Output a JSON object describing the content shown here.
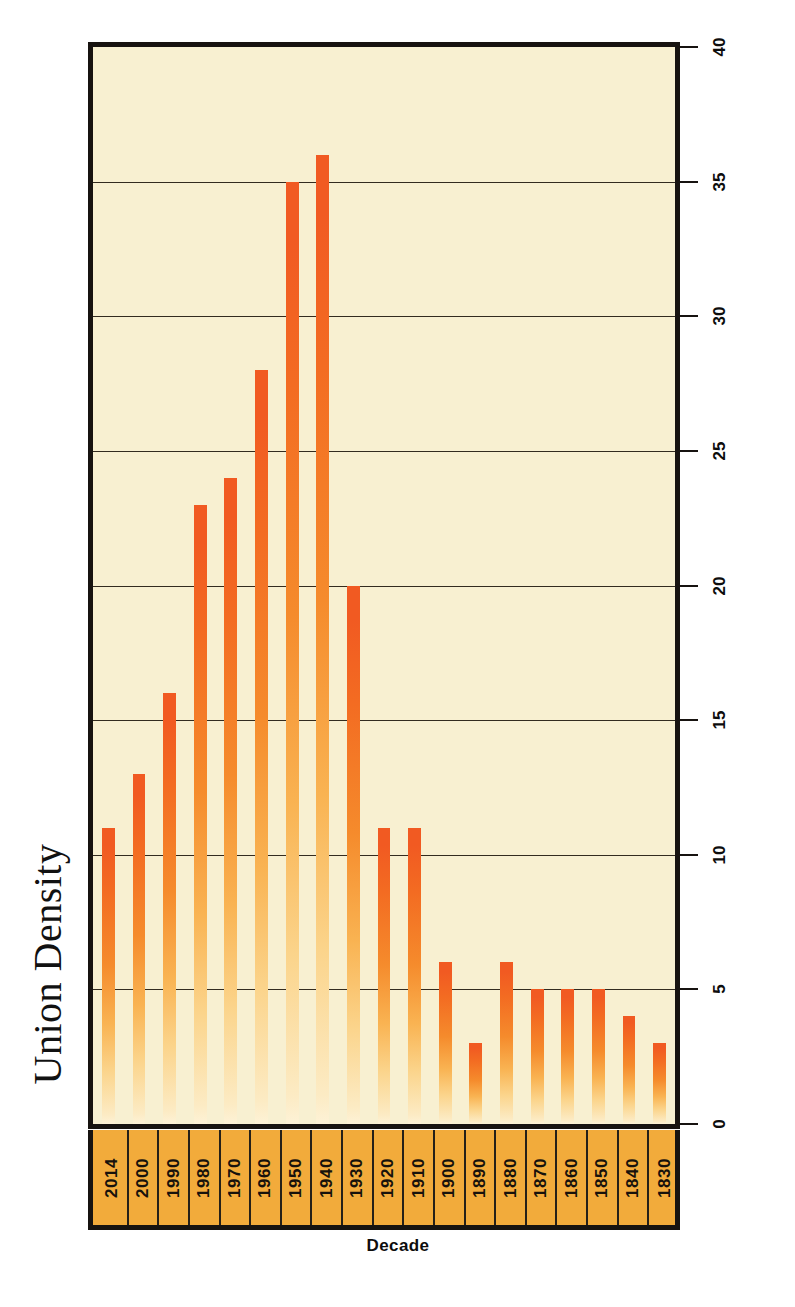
{
  "chart_data": {
    "type": "bar",
    "title": "Union Density",
    "xlabel": "Decade",
    "ylabel": "Percentage of Union Members in Labor Force",
    "orientation": "vertical-rotated-90ccw",
    "grid": true,
    "legend": false,
    "ylim": [
      0,
      40
    ],
    "ytick_step": 5,
    "yticks": [
      "0",
      "5",
      "10",
      "15",
      "20",
      "25",
      "30",
      "35",
      "40"
    ],
    "categories": [
      "2014",
      "2000",
      "1990",
      "1980",
      "1970",
      "1960",
      "1950",
      "1940",
      "1930",
      "1920",
      "1910",
      "1900",
      "1890",
      "1880",
      "1870",
      "1860",
      "1850",
      "1840",
      "1830"
    ],
    "values": [
      11,
      13,
      16,
      23,
      24,
      28,
      35,
      36,
      20,
      11,
      11,
      6,
      3,
      6,
      5,
      5,
      5,
      4,
      3
    ]
  },
  "colors": {
    "bar_top": "#f15a22",
    "bar_bottom": "#fdf2d6",
    "plot_background": "#f8f0d1",
    "category_band": "#f2ab3b",
    "frame": "#171310",
    "text": "#0d0d0d",
    "page_background": "#ffffff"
  }
}
